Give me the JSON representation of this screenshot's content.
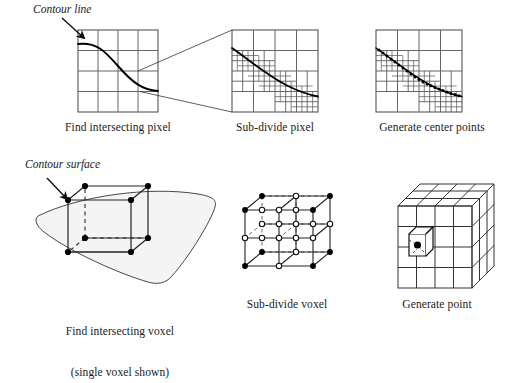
{
  "figure": {
    "annotations": {
      "contour_line": "Contour line",
      "contour_surface": "Contour surface"
    },
    "colors": {
      "ink": "#1a1a1a",
      "grid": "#555555",
      "grid_light": "#777777",
      "curve": "#000000",
      "point_fill": "#000000",
      "point_open": "#ffffff",
      "surface_fill": "#f2f2f2",
      "background": "#ffffff"
    },
    "panels": [
      {
        "id": "find-intersecting-pixel",
        "caption": "Find intersecting pixel",
        "caption_line2": "",
        "kind": "2d-grid",
        "grid": {
          "cols": 4,
          "rows": 4,
          "x": 78,
          "y": 30,
          "w": 80,
          "h": 82
        },
        "has_curve": true,
        "has_points": false
      },
      {
        "id": "sub-divide-pixel",
        "caption": "Sub-divide pixel",
        "caption_line2": "",
        "kind": "2d-grid-subdivided",
        "grid": {
          "cols": 4,
          "rows": 4,
          "x": 232,
          "y": 30,
          "w": 86,
          "h": 82
        },
        "has_curve": true,
        "has_points": false
      },
      {
        "id": "generate-center-points",
        "caption": "Generate center points",
        "caption_line2": "",
        "kind": "2d-grid-subdivided-points",
        "grid": {
          "cols": 4,
          "rows": 4,
          "x": 376,
          "y": 30,
          "w": 86,
          "h": 82
        },
        "has_curve": true,
        "has_points": true
      },
      {
        "id": "find-intersecting-voxel",
        "caption": "Find intersecting voxel",
        "caption_line2": "(single voxel shown)",
        "kind": "3d-voxel",
        "has_curve": true,
        "has_points": true
      },
      {
        "id": "sub-divide-voxel",
        "caption": "Sub-divide voxel",
        "caption_line2": "",
        "kind": "3d-voxel-subdivided",
        "has_curve": false,
        "has_points": true
      },
      {
        "id": "generate-point",
        "caption": "Generate point",
        "caption_line2": "",
        "kind": "3d-voxel-block",
        "has_curve": false,
        "has_points": true
      }
    ]
  }
}
